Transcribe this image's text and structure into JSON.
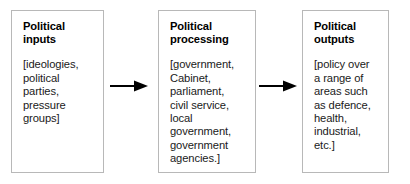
{
  "diagram": {
    "type": "flow-diagram",
    "orientation": "left-to-right",
    "stages": [
      {
        "id": "political-inputs",
        "title": "Political\ninputs",
        "body": "[ideologies,\npolitical\nparties,\npressure\ngroups]"
      },
      {
        "id": "political-processing",
        "title": "Political\nprocessing",
        "body": "[government,\nCabinet,\nparliament,\ncivil service,\nlocal\ngovernment,\ngovernment\nagencies.]"
      },
      {
        "id": "political-outputs",
        "title": "Political\noutputs",
        "body": "[policy over\na range of\nareas such\nas defence,\nhealth,\nindustrial,\netc.]"
      }
    ],
    "connectors": [
      {
        "id": "arrow-inputs-to-processing",
        "from": "political-inputs",
        "to": "political-processing",
        "glyph": "right-arrow"
      },
      {
        "id": "arrow-processing-to-outputs",
        "from": "political-processing",
        "to": "political-outputs",
        "glyph": "right-arrow"
      }
    ],
    "colors": {
      "background": "#ffffff",
      "box_border": "#b8b8b8",
      "title_text": "#000000",
      "body_text": "#1a1a1a",
      "arrow": "#000000"
    }
  }
}
